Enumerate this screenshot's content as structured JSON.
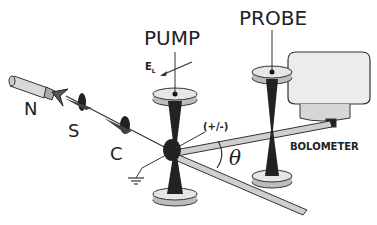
{
  "diagram": {
    "labels": {
      "pump": "PUMP",
      "probe": "PROBE",
      "field": "E",
      "field_sub": "L",
      "source": "N",
      "sample": "S",
      "collector": "C",
      "polarity": "(+/-)",
      "angle": "θ",
      "detector": "BOLOMETER"
    },
    "colors": {
      "ink": "#222222",
      "disk_top": "#e6e6e6",
      "disk_side": "#bdbdbd",
      "rod": "#cfcfcf",
      "detector_body": "#e9e9e9"
    }
  }
}
